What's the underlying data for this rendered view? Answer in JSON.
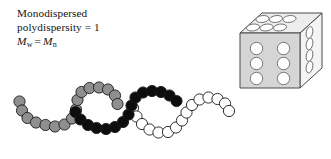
{
  "figure": {
    "name": "monodispersed-polymer-figure",
    "width": 331,
    "height": 159,
    "background": "#ffffff"
  },
  "caption": {
    "line1": "Monodispersed",
    "line2": "polydispersity = 1",
    "formula": {
      "m_symbol": "M",
      "weight_sub": "w",
      "equals": "=",
      "number_sub": "n"
    }
  },
  "colors": {
    "gray_fill": "#8f8f8f",
    "black_fill": "#0d0d0d",
    "white_fill": "#ffffff",
    "outline": "#1a1a1a",
    "cube_front": "#d5d5d5",
    "cube_top": "#ededed",
    "cube_side": "#f4f4f4",
    "cube_edge": "#4a4a4a",
    "pore_fill": "#ffffff",
    "text": "#131313"
  },
  "chains": [
    {
      "id": "chain-gray",
      "label": "gray-polymer-chain",
      "fill": "#8f8f8f",
      "radius": 5.6,
      "beads": [
        [
          19.5,
          101.5
        ],
        [
          22.0,
          110.5
        ],
        [
          27.5,
          118.0
        ],
        [
          36.0,
          122.5
        ],
        [
          45.5,
          125.0
        ],
        [
          55.0,
          126.5
        ],
        [
          64.5,
          124.5
        ],
        [
          72.0,
          118.5
        ],
        [
          76.0,
          109.5
        ],
        [
          77.5,
          100.0
        ],
        [
          81.5,
          92.0
        ],
        [
          89.5,
          88.0
        ],
        [
          99.0,
          87.5
        ],
        [
          108.0,
          89.5
        ],
        [
          115.0,
          95.5
        ],
        [
          117.5,
          104.0
        ]
      ]
    },
    {
      "id": "chain-black",
      "label": "black-polymer-chain",
      "fill": "#0d0d0d",
      "radius": 5.6,
      "beads": [
        [
          75.5,
          112.0
        ],
        [
          80.5,
          119.5
        ],
        [
          88.0,
          125.0
        ],
        [
          96.5,
          128.0
        ],
        [
          106.0,
          129.0
        ],
        [
          115.0,
          127.0
        ],
        [
          123.0,
          122.0
        ],
        [
          128.5,
          114.5
        ],
        [
          131.5,
          105.5
        ],
        [
          135.5,
          97.5
        ],
        [
          143.0,
          92.5
        ],
        [
          152.0,
          91.0
        ],
        [
          161.0,
          92.0
        ],
        [
          169.5,
          95.5
        ],
        [
          176.5,
          101.0
        ]
      ]
    },
    {
      "id": "chain-white",
      "label": "white-polymer-chain",
      "fill": "#ffffff",
      "radius": 5.6,
      "beads": [
        [
          133.0,
          108.0
        ],
        [
          136.5,
          116.5
        ],
        [
          142.0,
          124.0
        ],
        [
          149.5,
          129.5
        ],
        [
          158.5,
          132.5
        ],
        [
          168.0,
          132.0
        ],
        [
          176.0,
          127.5
        ],
        [
          182.0,
          120.5
        ],
        [
          186.5,
          112.5
        ],
        [
          192.0,
          105.0
        ],
        [
          199.5,
          99.5
        ],
        [
          208.5,
          97.5
        ],
        [
          217.5,
          99.0
        ],
        [
          225.0,
          103.5
        ],
        [
          229.0,
          111.0
        ]
      ]
    }
  ],
  "cube": {
    "label": "porous-cube-illustration",
    "front_face": {
      "name": "cube-front-face",
      "pores": [
        [
          258,
          120
        ],
        [
          279,
          120
        ],
        [
          258,
          143
        ],
        [
          279,
          143
        ],
        [
          258,
          166
        ],
        [
          279,
          166
        ]
      ],
      "pore_radius": 7.5,
      "pore_count": 6
    },
    "top_face": {
      "name": "cube-top-face",
      "pore_count": 6,
      "pore_rx": 7.8,
      "pore_ry": 4.0
    },
    "side_face": {
      "name": "cube-right-face",
      "pore_count": 4,
      "pore_rx": 3.6,
      "pore_ry": 7.2
    }
  }
}
